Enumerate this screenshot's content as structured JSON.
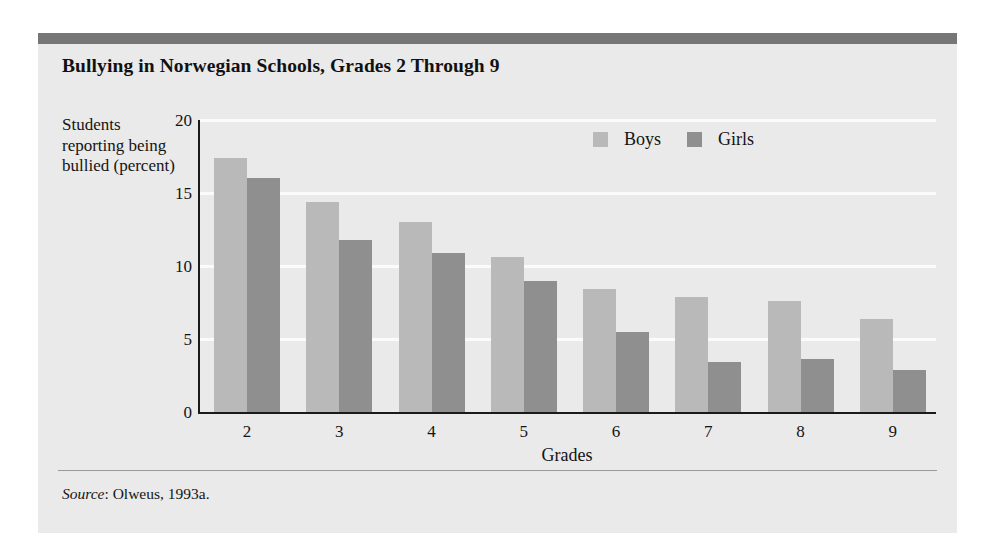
{
  "figure": {
    "title": "Bullying in Norwegian Schools, Grades 2 Through 9",
    "source_word": "Source",
    "source_text": ": Olweus, 1993a.",
    "panel_bg": "#eaeaea",
    "top_rule_color": "#767676"
  },
  "chart_data": {
    "type": "bar",
    "title": "Bullying in Norwegian Schools, Grades 2 Through 9",
    "xlabel": "Grades",
    "ylabel": "Students reporting being bullied (percent)",
    "categories": [
      "2",
      "3",
      "4",
      "5",
      "6",
      "7",
      "8",
      "9"
    ],
    "series": [
      {
        "name": "Boys",
        "color": "#b9b9b9",
        "values": [
          17.4,
          14.4,
          13.0,
          10.6,
          8.4,
          7.9,
          7.6,
          6.4
        ]
      },
      {
        "name": "Girls",
        "color": "#8f8f8f",
        "values": [
          16.0,
          11.8,
          10.9,
          9.0,
          5.5,
          3.4,
          3.6,
          2.9
        ]
      }
    ],
    "ylim": [
      0,
      20
    ],
    "yticks": [
      "0",
      "5",
      "10",
      "15",
      "20"
    ],
    "ytick_values": [
      0,
      5,
      10,
      15,
      20
    ],
    "grid": "horizontal-white",
    "legend_position": "upper-right-inside"
  }
}
